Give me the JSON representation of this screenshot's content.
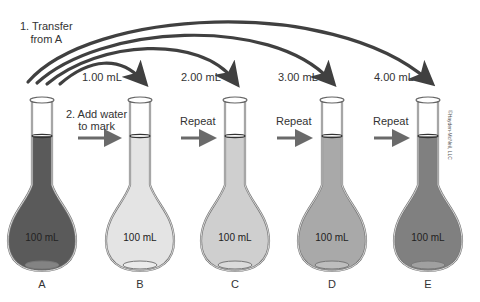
{
  "diagram": {
    "type": "serial dilution",
    "step1_label": "1. Transfer",
    "step1_label_line2": "from A",
    "step2_label": "2. Add water",
    "step2_label_line2": "to mark",
    "repeat_labels": [
      "Repeat",
      "Repeat",
      "Repeat"
    ],
    "transfer_volumes": [
      "1.00 mL",
      "2.00 mL",
      "3.00 mL",
      "4.00 mL"
    ],
    "copyright": "©Hayden-McNeil, LLC",
    "flasks": [
      {
        "letter": "A",
        "volume": "100 mL",
        "fill_color": "#5a5a5a"
      },
      {
        "letter": "B",
        "volume": "100 mL",
        "fill_color": "#e4e4e4"
      },
      {
        "letter": "C",
        "volume": "100 mL",
        "fill_color": "#cfcfcf"
      },
      {
        "letter": "D",
        "volume": "100 mL",
        "fill_color": "#a9a9a9"
      },
      {
        "letter": "E",
        "volume": "100 mL",
        "fill_color": "#808080"
      }
    ],
    "arrow_color": "#404040",
    "horizontal_arrow_color": "#6a6a6a"
  }
}
